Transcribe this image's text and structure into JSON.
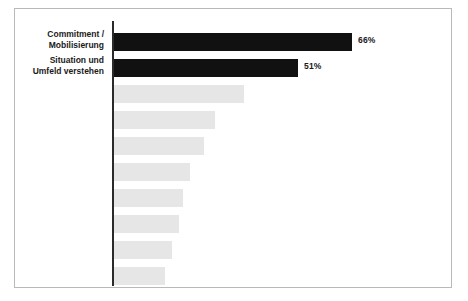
{
  "chart_data": {
    "type": "bar",
    "orientation": "horizontal",
    "title": "",
    "subtitle": "",
    "xlabel": "",
    "ylabel": "",
    "grid": false,
    "legend": null,
    "axis_line": true,
    "xlim": [
      0,
      70
    ],
    "value_suffix": "%",
    "categories": [
      "Commitment /\nMobilisierung",
      "Situation und\nUmfeld verstehen",
      "",
      "",
      "",
      "",
      "",
      "",
      "",
      ""
    ],
    "values": [
      66,
      51,
      36,
      28,
      25,
      21,
      19,
      18,
      16,
      14
    ],
    "labeled_values": [
      "66%",
      "51%",
      "",
      "",
      "",
      "",
      "",
      "",
      "",
      ""
    ],
    "bars": [
      {
        "label": "Commitment /\nMobilisierung",
        "value": 66,
        "value_label": "66%",
        "style": "highlight"
      },
      {
        "label": "Situation und\nUmfeld verstehen",
        "value": 51,
        "value_label": "51%",
        "style": "highlight"
      },
      {
        "label": "",
        "value": 36,
        "value_label": "",
        "style": "muted"
      },
      {
        "label": "",
        "value": 28,
        "value_label": "",
        "style": "muted"
      },
      {
        "label": "",
        "value": 25,
        "value_label": "",
        "style": "muted"
      },
      {
        "label": "",
        "value": 21,
        "value_label": "",
        "style": "muted"
      },
      {
        "label": "",
        "value": 19,
        "value_label": "",
        "style": "muted"
      },
      {
        "label": "",
        "value": 18,
        "value_label": "",
        "style": "muted"
      },
      {
        "label": "",
        "value": 16,
        "value_label": "",
        "style": "muted"
      },
      {
        "label": "",
        "value": 14,
        "value_label": "",
        "style": "muted"
      }
    ],
    "colors": {
      "highlight_bar": "#111111",
      "muted_bar": "#e6e6e6",
      "axis_line": "#2b2b2b",
      "frame_border": "#b9b9b9",
      "text": "#1a1a1a",
      "background": "#ffffff"
    }
  }
}
